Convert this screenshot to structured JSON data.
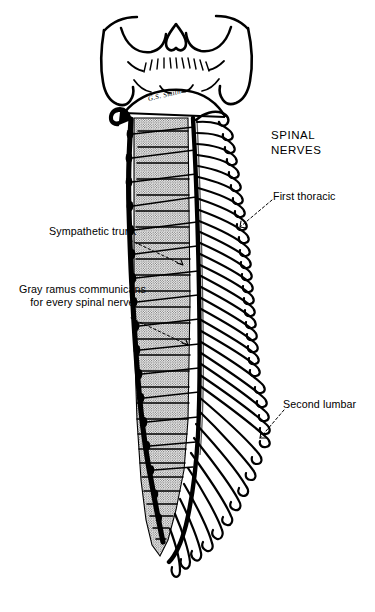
{
  "figure": {
    "background_color": "#ffffff",
    "ink_color": "#000000",
    "bone_fill_color": "#e3e3e3",
    "signature": "G.S. Smith"
  },
  "labels": {
    "spinal_nerves": "SPINAL\nNERVES",
    "first_thoracic": "First thoracic",
    "second_lumbar": "Second lumbar",
    "sympathetic_trunk": "Sympathetic trunk",
    "gray_ramus": "Gray ramus communicans\nfor every spinal nerve"
  },
  "structures": {
    "skull": "occipital-bone-base",
    "vertebral_column": "stippled-vertebral-bodies",
    "trunk": "sympathetic-chain",
    "nerves": "spinal-nerve-roots",
    "cauda": "cauda-equina"
  },
  "counts": {
    "vertebral_segments": 27,
    "spinal_nerve_pairs": 31
  }
}
